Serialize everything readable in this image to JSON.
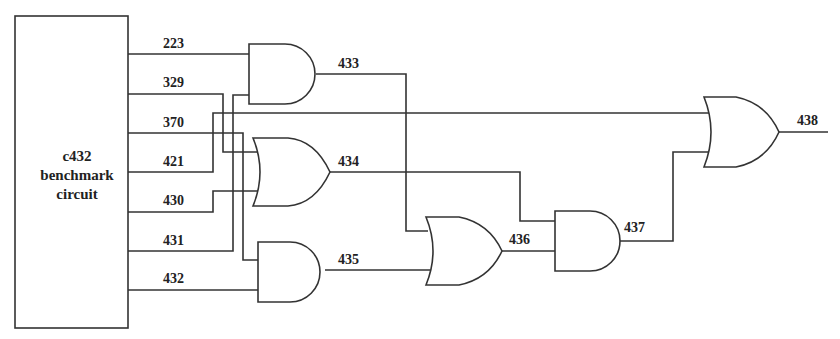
{
  "diagram": {
    "type": "logic-circuit",
    "block": {
      "label_line1": "c432",
      "label_line2": "benchmark",
      "label_line3": "circuit"
    },
    "signals": {
      "s223": "223",
      "s329": "329",
      "s370": "370",
      "s421": "421",
      "s430": "430",
      "s431": "431",
      "s432": "432",
      "s433": "433",
      "s434": "434",
      "s435": "435",
      "s436": "436",
      "s437": "437",
      "s438": "438"
    },
    "gates": [
      {
        "id": "g433",
        "type": "AND",
        "inputs": [
          "223",
          "431"
        ],
        "output": "433"
      },
      {
        "id": "g434",
        "type": "OR",
        "inputs": [
          "329",
          "430"
        ],
        "output": "434"
      },
      {
        "id": "g435",
        "type": "AND",
        "inputs": [
          "370",
          "432"
        ],
        "output": "435"
      },
      {
        "id": "g436",
        "type": "OR",
        "inputs": [
          "433",
          "435"
        ],
        "output": "436"
      },
      {
        "id": "g437",
        "type": "AND",
        "inputs": [
          "434",
          "436"
        ],
        "output": "437"
      },
      {
        "id": "g438",
        "type": "OR",
        "inputs": [
          "421",
          "437"
        ],
        "output": "438"
      }
    ]
  }
}
